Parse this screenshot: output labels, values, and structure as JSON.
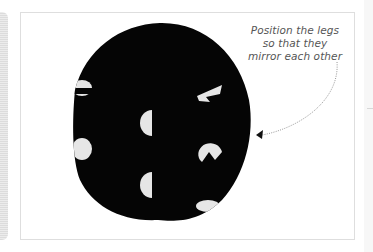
{
  "page": {
    "annotation": {
      "lines": [
        "Position the legs",
        "so that they",
        "mirror each other"
      ]
    },
    "illustration": {
      "subject": "black polka-dot fabric circle",
      "fabric_color": "#050505",
      "dot_color": "#e6e6e6",
      "arrow_style": "dotted",
      "arrow_color": "#888888"
    }
  }
}
